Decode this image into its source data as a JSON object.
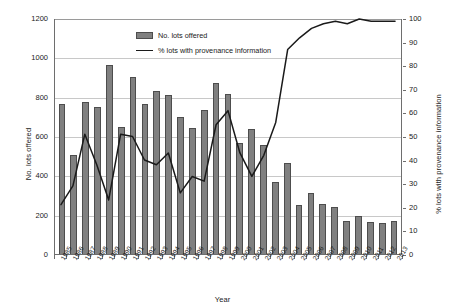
{
  "chart_data": {
    "type": "bar",
    "title": "",
    "xlabel": "Year",
    "ylabel": "No. lots offered",
    "y2label": "% lots with provenance information",
    "grid": true,
    "legend_position": "top-center-inside",
    "ylim": [
      0,
      1200
    ],
    "y2lim": [
      0,
      100
    ],
    "yticks": [
      0,
      200,
      400,
      600,
      800,
      1000,
      1200
    ],
    "y2ticks": [
      0,
      10,
      20,
      30,
      40,
      50,
      60,
      70,
      80,
      90,
      100
    ],
    "categories": [
      "1985",
      "1986",
      "1987",
      "1988",
      "1989",
      "1990",
      "1991",
      "1992",
      "1993",
      "1994",
      "1995",
      "1996",
      "1997",
      "1998",
      "1999",
      "2000",
      "2001",
      "2002",
      "2003",
      "2004",
      "2005",
      "2006",
      "2007",
      "2008",
      "2009",
      "2010",
      "2011",
      "2012",
      "2013"
    ],
    "series": [
      {
        "name": "No. lots offered",
        "kind": "bar",
        "axis": "left",
        "color": "#808080",
        "values": [
          762,
          504,
          775,
          749,
          963,
          646,
          902,
          762,
          829,
          810,
          695,
          639,
          730,
          870,
          812,
          562,
          638,
          553,
          367,
          461,
          251,
          310,
          252,
          241,
          167,
          195,
          162,
          160,
          169
        ]
      },
      {
        "name": "% lots with provenance information",
        "kind": "line",
        "axis": "right",
        "color": "#1a1a1a",
        "values": [
          21,
          29,
          51,
          38,
          23,
          51,
          50,
          40,
          38,
          43,
          26,
          33,
          31,
          55,
          61,
          43,
          33,
          42,
          56,
          87,
          92,
          96,
          98,
          99,
          98,
          100,
          99,
          99,
          99
        ]
      }
    ]
  },
  "legend": {
    "items": [
      {
        "label": "No. lots offered",
        "marker": "bar-swatch"
      },
      {
        "label": "% lots with provenance information",
        "marker": "line-swatch"
      }
    ]
  },
  "axes": {
    "left": {
      "title": "No. lots offered",
      "ticks": [
        "0",
        "200",
        "400",
        "600",
        "800",
        "1000",
        "1200"
      ]
    },
    "right": {
      "title": "% lots with provenance information",
      "ticks": [
        "0",
        "10",
        "20",
        "30",
        "40",
        "50",
        "60",
        "70",
        "80",
        "90",
        "100"
      ]
    },
    "bottom": {
      "title": "Year"
    }
  }
}
